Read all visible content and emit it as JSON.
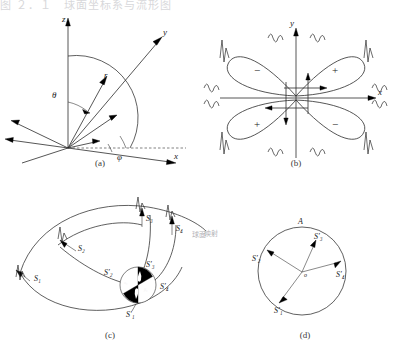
{
  "page": {
    "top_partial_text": "图 ２．１　球面坐标系与流形图"
  },
  "captions": {
    "a": "(a)",
    "b": "(b)",
    "c": "(c)",
    "d": "(d)"
  },
  "panel_a": {
    "name": "spherical-coordinate-system",
    "axes": {
      "x": "x",
      "y": "y",
      "z": "z"
    },
    "radius_label": "r",
    "polar_angle_label": "θ",
    "azimuth_angle_label": "φ"
  },
  "panel_b": {
    "name": "four-lobe-orbital-pattern",
    "axes": {
      "x": "x",
      "y": "y"
    },
    "lobe_signs": {
      "upper_left": "−",
      "upper_right": "+",
      "lower_left": "+",
      "lower_right": "−"
    },
    "wavelet_icon": "wavelet-spike-icon",
    "wavelet_count": 12
  },
  "panel_c": {
    "name": "vector-mapping-diagram",
    "source_vectors": [
      "S₁",
      "S₂",
      "S₃",
      "S₄"
    ],
    "mapped_vectors": [
      "S′₁",
      "S′₂",
      "S′₃",
      "S′₄"
    ],
    "center_angles": [
      "α₀",
      "β₀"
    ],
    "side_note": "球面",
    "wavelet_icon": "wavelet-spike-icon"
  },
  "panel_d": {
    "name": "mapped-vector-circle",
    "vectors": [
      "S′₁",
      "S′₂",
      "S′₃",
      "S′₄"
    ],
    "origin_label": "o",
    "circle_top_label": "A",
    "side_note": "映射"
  },
  "colors": {
    "ink": "#1a1a1a",
    "line": "#2b2b2b",
    "fill_black": "#000000",
    "background": "#ffffff",
    "faint_text": "#b9b9bd"
  }
}
